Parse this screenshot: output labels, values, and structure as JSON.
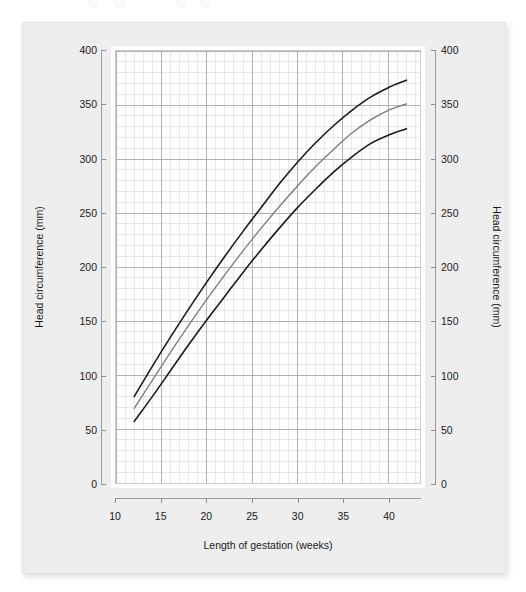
{
  "figure": {
    "background_color": "#ffffff",
    "card_color": "#eeeeee",
    "panel_color": "#ffffff"
  },
  "axes": {
    "x_title": "Length of gestation (weeks)",
    "y_title_left": "Head circumference (mm)",
    "y_title_right": "Head circumference (mm)",
    "x_ticks": [
      "10",
      "15",
      "20",
      "25",
      "30",
      "35",
      "40"
    ],
    "y_ticks": [
      "0",
      "50",
      "100",
      "150",
      "200",
      "250",
      "300",
      "350",
      "400"
    ]
  },
  "chart_data": {
    "type": "line",
    "title": "",
    "xlabel": "Length of gestation (weeks)",
    "ylabel": "Head circumference (mm)",
    "xlim": [
      10,
      43.5
    ],
    "ylim": [
      0,
      400
    ],
    "xticks": [
      10,
      15,
      20,
      25,
      30,
      35,
      40
    ],
    "yticks": [
      0,
      50,
      100,
      150,
      200,
      250,
      300,
      350,
      400
    ],
    "grid": true,
    "grid_minor": true,
    "grid_major_step_x": 5,
    "grid_major_step_y": 50,
    "grid_minor_step_x": 1,
    "grid_minor_step_y": 10,
    "legend": "none",
    "legend_position": "none",
    "x": [
      12,
      14,
      16,
      18,
      20,
      22,
      24,
      26,
      28,
      30,
      32,
      34,
      36,
      38,
      40,
      42
    ],
    "series": [
      {
        "name": "Upper centile",
        "color": "#1a1a1a",
        "width": 1.6,
        "values": [
          80,
          108,
          135,
          161,
          186,
          210,
          233,
          255,
          277,
          297,
          315,
          331,
          345,
          357,
          366,
          373
        ]
      },
      {
        "name": "Median",
        "color": "#7a7a7a",
        "width": 1.3,
        "values": [
          69,
          95,
          121,
          146,
          170,
          193,
          215,
          236,
          256,
          275,
          293,
          309,
          324,
          336,
          345,
          351
        ]
      },
      {
        "name": "Lower centile",
        "color": "#1a1a1a",
        "width": 1.6,
        "values": [
          57,
          80,
          104,
          128,
          151,
          173,
          195,
          216,
          236,
          255,
          272,
          288,
          302,
          314,
          322,
          328
        ]
      }
    ]
  },
  "colors": {
    "grid_major": "#9d9da6",
    "grid_minor": "#dcdce4",
    "panel_border": "#c9c9cf",
    "tick": "#8e8e94",
    "text": "#1b1b1b"
  }
}
